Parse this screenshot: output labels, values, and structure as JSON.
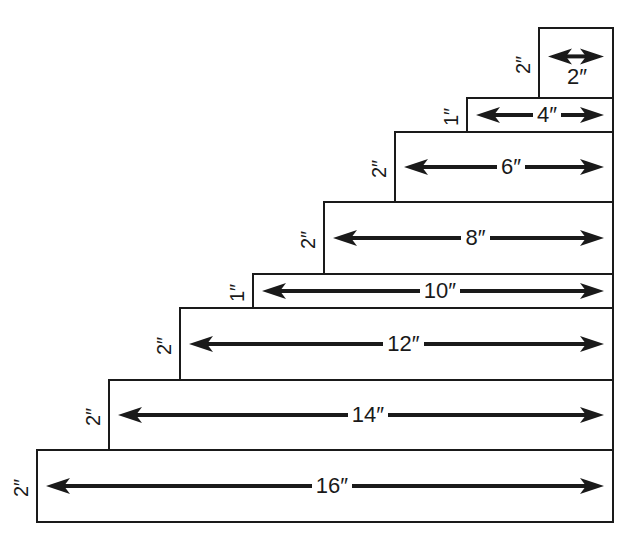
{
  "diagram": {
    "type": "stepped-dimension-diagram",
    "steps": [
      {
        "width_label": "2″",
        "height_label": "2″",
        "box": {
          "x": 538,
          "y": 27,
          "w": 74,
          "h": 70
        },
        "label_below_arrow": true
      },
      {
        "width_label": "4″",
        "height_label": "1″",
        "box": {
          "x": 466,
          "y": 97,
          "w": 146,
          "h": 34
        }
      },
      {
        "width_label": "6″",
        "height_label": "2″",
        "box": {
          "x": 394,
          "y": 131,
          "w": 218,
          "h": 70
        }
      },
      {
        "width_label": "8″",
        "height_label": "2″",
        "box": {
          "x": 323,
          "y": 201,
          "w": 289,
          "h": 72
        }
      },
      {
        "width_label": "10″",
        "height_label": "1″",
        "box": {
          "x": 252,
          "y": 273,
          "w": 360,
          "h": 34
        }
      },
      {
        "width_label": "12″",
        "height_label": "2″",
        "box": {
          "x": 179,
          "y": 307,
          "w": 433,
          "h": 72
        }
      },
      {
        "width_label": "14″",
        "height_label": "2″",
        "box": {
          "x": 108,
          "y": 379,
          "w": 504,
          "h": 70
        }
      },
      {
        "width_label": "16″",
        "height_label": "2″",
        "box": {
          "x": 36,
          "y": 449,
          "w": 576,
          "h": 72
        }
      }
    ],
    "colors": {
      "line": "#1a1a1a",
      "background": "#ffffff"
    }
  }
}
